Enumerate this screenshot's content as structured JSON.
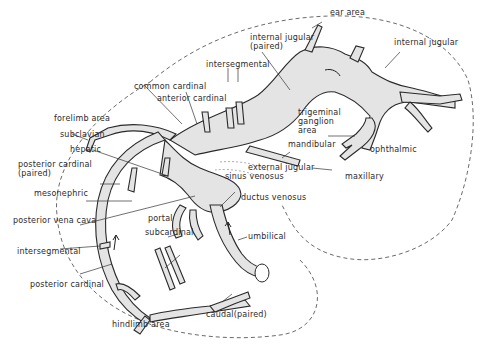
{
  "figure": {
    "colors": {
      "line": "#2a2a2a",
      "vessel_fill": "#e4e4e4",
      "background": "#ffffff"
    }
  },
  "labels": {
    "ear_area": "ear area",
    "internal_jugular_paired": "internal jugular\n(paired)",
    "internal_jugular": "internal jugular",
    "intersegmental_top": "intersegmental",
    "common_cardinal": "common cardinal",
    "anterior_cardinal": "anterior cardinal",
    "trigeminal_ganglion_area": "trigeminal\nganglion\narea",
    "forelimb_area": "forelimb area",
    "subclavian": "subclavian",
    "mandibular": "mandibular",
    "ophthalmic": "ophthalmic",
    "hepatic": "hepatic",
    "external_jugular": "external jugular",
    "posterior_cardinal_paired": "posterior cardinal\n(paired)",
    "sinus_venosus": "sinus venosus",
    "maxillary": "maxillary",
    "mesonephric": "mesonephric",
    "ductus_venosus": "ductus venosus",
    "posterior_vena_cava": "posterior vena cava",
    "portal": "portal",
    "subcardinal": "subcardinal",
    "umbilical": "umbilical",
    "intersegmental_bottom": "intersegmental",
    "posterior_cardinal": "posterior cardinal",
    "caudal_paired": "caudal(paired)",
    "hindlimb_area": "hindlimb area"
  }
}
